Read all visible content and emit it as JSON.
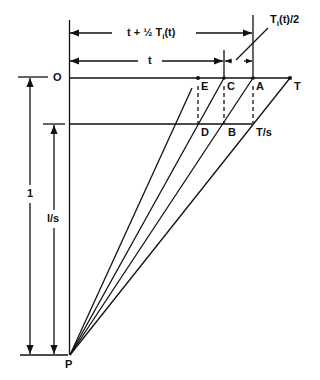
{
  "diagram": {
    "type": "geometric-timing-diagram",
    "colors": {
      "stroke": "#111111",
      "background": "#ffffff"
    },
    "points": [
      {
        "id": "O",
        "label": "O"
      },
      {
        "id": "E",
        "label": "E"
      },
      {
        "id": "C",
        "label": "C"
      },
      {
        "id": "A",
        "label": "A"
      },
      {
        "id": "T",
        "label": "T"
      },
      {
        "id": "D",
        "label": "D"
      },
      {
        "id": "B",
        "label": "B"
      },
      {
        "id": "Ts",
        "label": "T/s"
      },
      {
        "id": "P",
        "label": "P"
      }
    ],
    "dimensions": {
      "top_span": {
        "main": "t + ½ T",
        "sub": "i",
        "tail": "(t)"
      },
      "t_span": {
        "label": "t"
      },
      "half_ti": {
        "main": "T",
        "sub": "i",
        "tail": "(t)/2"
      },
      "vertical_one": {
        "label": "1"
      },
      "vertical_ls": {
        "label": "l/s"
      }
    }
  }
}
